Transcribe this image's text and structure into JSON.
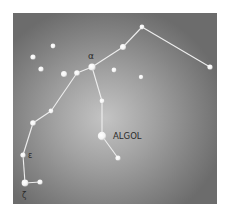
{
  "diagram": {
    "type": "star-chart",
    "constellation_lines": [
      [
        [
          25,
          183
        ],
        [
          40,
          182
        ]
      ],
      [
        [
          25,
          183
        ],
        [
          23,
          155
        ]
      ],
      [
        [
          23,
          155
        ],
        [
          33,
          123
        ]
      ],
      [
        [
          33,
          123
        ],
        [
          51,
          111
        ]
      ],
      [
        [
          51,
          111
        ],
        [
          77,
          73
        ]
      ],
      [
        [
          77,
          73
        ],
        [
          92,
          67
        ]
      ],
      [
        [
          92,
          67
        ],
        [
          123,
          47
        ]
      ],
      [
        [
          123,
          47
        ],
        [
          142,
          27
        ]
      ],
      [
        [
          142,
          27
        ],
        [
          210,
          67
        ]
      ],
      [
        [
          92,
          67
        ],
        [
          102,
          101
        ]
      ],
      [
        [
          102,
          101
        ],
        [
          102,
          136
        ]
      ],
      [
        [
          102,
          136
        ],
        [
          118,
          158
        ]
      ]
    ],
    "stars": [
      {
        "id": "alpha",
        "x": 92,
        "y": 67,
        "r": 3.6
      },
      {
        "id": "algol",
        "x": 102,
        "y": 136,
        "r": 4.2
      },
      {
        "id": "epsilon",
        "x": 23,
        "y": 155,
        "r": 2.6
      },
      {
        "id": "zeta",
        "x": 25,
        "y": 183,
        "r": 3.4
      },
      {
        "id": "s1",
        "x": 40,
        "y": 182,
        "r": 2.6
      },
      {
        "id": "s2",
        "x": 33,
        "y": 123,
        "r": 2.8
      },
      {
        "id": "s3",
        "x": 51,
        "y": 111,
        "r": 2.4
      },
      {
        "id": "s4",
        "x": 77,
        "y": 73,
        "r": 2.8
      },
      {
        "id": "s5",
        "x": 123,
        "y": 47,
        "r": 3.0
      },
      {
        "id": "s6",
        "x": 142,
        "y": 27,
        "r": 2.4
      },
      {
        "id": "s7",
        "x": 210,
        "y": 67,
        "r": 2.6
      },
      {
        "id": "s8",
        "x": 102,
        "y": 101,
        "r": 2.4
      },
      {
        "id": "s9",
        "x": 118,
        "y": 158,
        "r": 2.6
      },
      {
        "id": "f1",
        "x": 53,
        "y": 46,
        "r": 2.4
      },
      {
        "id": "f2",
        "x": 33,
        "y": 57,
        "r": 2.6
      },
      {
        "id": "f3",
        "x": 41,
        "y": 69,
        "r": 2.6
      },
      {
        "id": "f4",
        "x": 64,
        "y": 74,
        "r": 3.0
      },
      {
        "id": "f5",
        "x": 114,
        "y": 70,
        "r": 2.4
      },
      {
        "id": "f6",
        "x": 141,
        "y": 77,
        "r": 2.2
      }
    ],
    "labels": {
      "alpha": "α",
      "algol": "ALGOL",
      "epsilon": "ε",
      "zeta": "ζ"
    },
    "colors": {
      "line": "#eeeeee",
      "star": "#ffffff",
      "label": "#2a2a2a"
    }
  }
}
